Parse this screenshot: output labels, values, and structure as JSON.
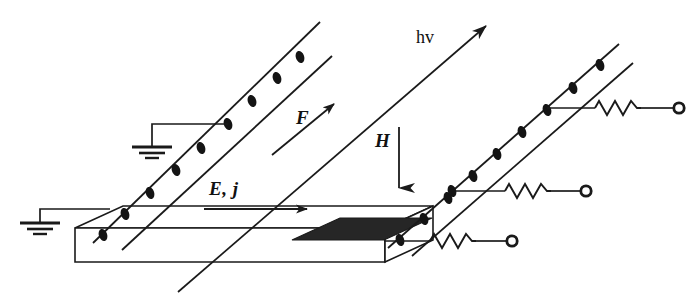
{
  "figure": {
    "width": 695,
    "height": 303,
    "background_color": "#ffffff",
    "ink_color": "#1a1a1a"
  },
  "labels": {
    "current_field": "E, j",
    "force": "F",
    "magnetic_field": "H",
    "photon": "hv"
  },
  "icons": {
    "ground": "ground-icon",
    "resistor": "resistor-icon",
    "terminal": "open-terminal-icon",
    "carrier": "carrier-dot-icon",
    "arrow": "arrow-icon"
  },
  "colors": {
    "line": "#1a1a1a",
    "contact_bar": "#262626",
    "carrier": "#141414"
  },
  "geometry": {
    "rails": [
      {
        "name": "left-rail",
        "upper": [
          [
            95,
            240
          ],
          [
            318,
            22
          ]
        ],
        "lower": [
          [
            120,
            247
          ],
          [
            330,
            55
          ]
        ],
        "carrier_count": 8
      },
      {
        "name": "right-rail",
        "upper": [
          [
            390,
            245
          ],
          [
            617,
            45
          ]
        ],
        "lower": [
          [
            408,
            252
          ],
          [
            630,
            64
          ]
        ],
        "carrier_count": 9
      }
    ],
    "slab": {
      "front_top_left": [
        75,
        228
      ],
      "front_top_right": [
        385,
        228
      ],
      "front_bottom_left": [
        75,
        262
      ],
      "front_bottom_right": [
        385,
        262
      ],
      "depth_dx": 48,
      "depth_dy": -22
    },
    "contact_bar": {
      "x": 292,
      "y": 234,
      "w": 92,
      "h": 11
    },
    "grounds": [
      {
        "tap_x": 218,
        "tap_y": 112,
        "stem_x": 152,
        "symbol_y": 148
      },
      {
        "tap_x": 112,
        "tap_y": 207,
        "stem_x": 38,
        "symbol_y": 224
      }
    ],
    "resistor_taps": [
      {
        "tap_x": 549,
        "tap_y": 106,
        "end_x": 683
      },
      {
        "tap_x": 458,
        "tap_y": 190,
        "end_x": 600
      },
      {
        "tap_x": 385,
        "tap_y": 240,
        "end_x": 528
      }
    ],
    "vectors": {
      "ej_arrow": [
        [
          205,
          208
        ],
        [
          313,
          208
        ]
      ],
      "f_arrow": [
        [
          272,
          155
        ],
        [
          337,
          103
        ]
      ],
      "h_arrow": [
        [
          399,
          128
        ],
        [
          399,
          190
        ]
      ],
      "hv_arrow": [
        [
          338,
          230
        ],
        [
          492,
          22
        ]
      ]
    }
  }
}
